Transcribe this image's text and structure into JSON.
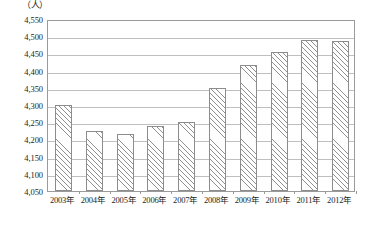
{
  "chart_data": {
    "type": "bar",
    "title": "",
    "subtitle": "",
    "unit_label": "（人）",
    "xlabel": "",
    "ylabel": "",
    "ylim": [
      4050,
      4550
    ],
    "ytick_step": 50,
    "grid": true,
    "legend": null,
    "categories": [
      "2003年",
      "2004年",
      "2005年",
      "2006年",
      "2007年",
      "2008年",
      "2009年",
      "2010年",
      "2011年",
      "2012年"
    ],
    "values": [
      4300,
      4225,
      4215,
      4240,
      4250,
      4350,
      4415,
      4455,
      4490,
      4485
    ],
    "ytick_labels": [
      "4,550",
      "4,500",
      "4,450",
      "4,400",
      "4,350",
      "4,300",
      "4,250",
      "4,200",
      "4,150",
      "4,100",
      "4,050"
    ],
    "ytick_values": [
      4550,
      4500,
      4450,
      4400,
      4350,
      4300,
      4250,
      4200,
      4150,
      4100,
      4050
    ],
    "series": [
      {
        "name": "人数",
        "values": [
          4300,
          4225,
          4215,
          4240,
          4250,
          4350,
          4415,
          4455,
          4490,
          4485
        ]
      }
    ],
    "colors": {
      "bar_fill": "#fefefe",
      "bar_hatch": "#8f8f8f",
      "bar_border": "#8c8c8c",
      "gridline": "#bfbfbf",
      "axis": "#9a9a9a",
      "text": "#231f20",
      "background": "#ffffff"
    }
  }
}
